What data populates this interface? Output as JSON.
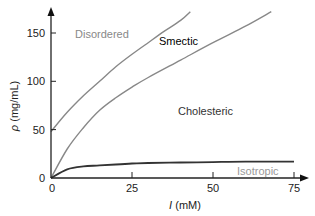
{
  "chart_data": {
    "type": "line",
    "title": "",
    "xlabel": "I (mM)",
    "ylabel": "ρ (mg/mL)",
    "xlim": [
      0,
      77
    ],
    "ylim": [
      0,
      175
    ],
    "xticks": [
      0,
      25,
      50,
      75
    ],
    "yticks": [
      0,
      50,
      100,
      150
    ],
    "grid": false,
    "legend": "none",
    "series": [
      {
        "name": "Disordered–Smectic boundary",
        "color": "#888888",
        "x": [
          0,
          5,
          10,
          15,
          20,
          25,
          30,
          35,
          40,
          43
        ],
        "y": [
          48,
          68,
          85,
          100,
          115,
          128,
          140,
          152,
          163,
          172
        ]
      },
      {
        "name": "Smectic–Cholesteric boundary",
        "color": "#888888",
        "x": [
          0,
          5,
          10,
          15,
          20,
          25,
          30,
          40,
          50,
          60,
          68
        ],
        "y": [
          0,
          30,
          52,
          70,
          83,
          94,
          104,
          122,
          140,
          157,
          172
        ]
      },
      {
        "name": "Cholesteric–Isotropic boundary",
        "color": "#333333",
        "x": [
          0,
          5,
          10,
          15,
          20,
          25,
          30,
          40,
          50,
          60,
          75
        ],
        "y": [
          0,
          9,
          12,
          13,
          14,
          15,
          15.5,
          16,
          16.5,
          17,
          17
        ]
      }
    ],
    "annotations": [
      {
        "text": "Disordered",
        "x": 8,
        "y": 147,
        "color": "#888888"
      },
      {
        "text": "Smectic",
        "x": 34,
        "y": 131,
        "color": "#000000"
      },
      {
        "text": "Cholesteric",
        "x": 40,
        "y": 68,
        "color": "#333333"
      },
      {
        "text": "Isotropic",
        "x": 59,
        "y": 5,
        "color": "#999999"
      }
    ]
  },
  "labels": {
    "xlabel_italic": "I",
    "xlabel_unit": " (mM)",
    "ylabel_italic": "ρ",
    "ylabel_unit": " (mg/mL)",
    "xtick_0": "0",
    "xtick_25": "25",
    "xtick_50": "50",
    "xtick_75": "75",
    "ytick_0": "0",
    "ytick_50": "50",
    "ytick_100": "100",
    "ytick_150": "150",
    "disordered": "Disordered",
    "smectic": "Smectic",
    "cholesteric": "Cholesteric",
    "isotropic": "Isotropic"
  }
}
